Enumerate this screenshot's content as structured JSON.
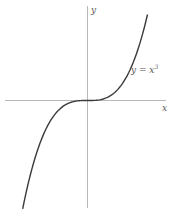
{
  "chart_data": {
    "type": "line",
    "title": "",
    "xlabel": "x",
    "ylabel": "y",
    "annotations": [
      "y = x³"
    ],
    "series": [
      {
        "name": "y = x³",
        "x": [
          -1.08,
          -1.0,
          -0.8,
          -0.6,
          -0.4,
          -0.2,
          0.0,
          0.2,
          0.4,
          0.6,
          0.8,
          1.0
        ],
        "values": [
          -1.26,
          -1.0,
          -0.512,
          -0.216,
          -0.064,
          -0.008,
          0.0,
          0.008,
          0.064,
          0.216,
          0.512,
          1.0
        ]
      }
    ],
    "grid": false,
    "legend": "none",
    "axes": "centered at origin, no ticks"
  },
  "labels": {
    "x_axis": "x",
    "y_axis": "y",
    "curve": "y = x",
    "curve_exp": "3"
  },
  "colors": {
    "axis": "#b0b0b0",
    "curve": "#3a3a3a",
    "text": "#555555"
  }
}
